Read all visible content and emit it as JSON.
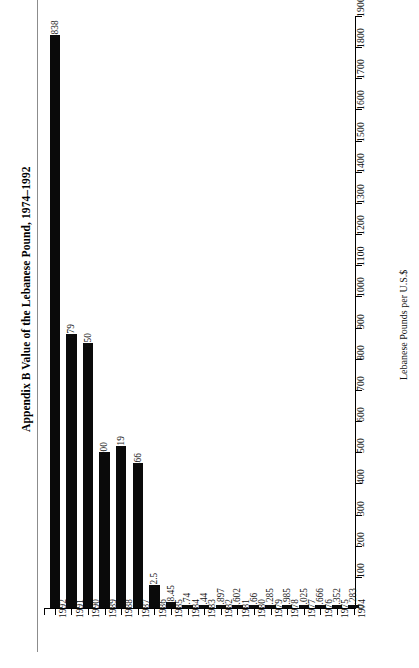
{
  "figure": {
    "label": "Appendix B",
    "title": "Appendix B  Value of the Lebanese Pound, 1974–1992"
  },
  "chart_data": {
    "type": "bar",
    "title": "Appendix B  Value of the Lebanese Pound, 1974–1992",
    "xlabel": "",
    "ylabel": "Lebanese Pounds per U.S.$",
    "categories": [
      "1992",
      "1991",
      "1990",
      "1989",
      "1988",
      "1987",
      "1986",
      "1985",
      "1984",
      "1983",
      "1982",
      "1981",
      "1980",
      "1979",
      "1978",
      "1977",
      "1976",
      "1975",
      "1974"
    ],
    "values": [
      1838,
      879,
      850,
      500,
      519,
      466,
      72.5,
      18.45,
      8.74,
      5.44,
      3.897,
      4.602,
      3.66,
      3.285,
      2.985,
      3.025,
      2.666,
      2.352,
      2.283
    ],
    "value_labels": [
      "1838",
      "879",
      "850",
      "500",
      "519",
      "466",
      "72.5",
      "18.45",
      "8.74",
      "5.44",
      "3.897",
      "4.602",
      "3.66",
      "3.285",
      "2.985",
      "3.025",
      "2.666",
      "2.352",
      "2.283"
    ],
    "ylim": [
      0,
      1900
    ],
    "ytick_step": 100,
    "yticks": [
      0,
      100,
      200,
      300,
      400,
      500,
      600,
      700,
      800,
      900,
      1000,
      1100,
      1200,
      1300,
      1400,
      1500,
      1600,
      1700,
      1800,
      1900
    ],
    "ytick_labels": [
      "0",
      "100",
      "200",
      "300",
      "400",
      "500",
      "600",
      "700",
      "800",
      "900",
      "1000",
      "1100",
      "1200",
      "1300",
      "1400",
      "1500",
      "1600",
      "1700",
      "1800",
      "1900"
    ],
    "grid": false,
    "legend": null,
    "legend_position": "none",
    "y_axis_side": "right",
    "bar_color": "#0a0a0a",
    "orientation": "vertical",
    "data_labels_shown": true,
    "data_labels_rotation_deg": 90,
    "xtick_rotation_deg": 90
  }
}
